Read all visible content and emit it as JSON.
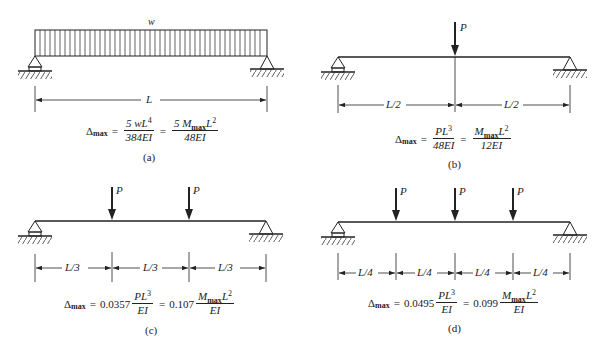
{
  "panels": [
    {
      "id": "a",
      "load_label": "w",
      "load_type": "uniform distributed",
      "dimensions": [
        "L"
      ],
      "formula": {
        "lhs": "Δ",
        "lhs_sub": "max",
        "eq": "=",
        "term1_coef": "",
        "term1_num": "5 wL",
        "term1_num_sup": "4",
        "term1_den": "384EI",
        "eq2": "=",
        "term2_coef": "",
        "term2_num_pre": "5 M",
        "term2_num_sub": "max",
        "term2_num_post": "L",
        "term2_num_sup": "2",
        "term2_den": "48EI"
      },
      "caption": "(a)"
    },
    {
      "id": "b",
      "load_label": "P",
      "load_type": "single point load at midspan",
      "dimensions": [
        "L/2",
        "L/2"
      ],
      "formula": {
        "lhs": "Δ",
        "lhs_sub": "max",
        "eq": "=",
        "term1_coef": "",
        "term1_num": "PL",
        "term1_num_sup": "3",
        "term1_den": "48EI",
        "eq2": "=",
        "term2_coef": "",
        "term2_num_pre": "M",
        "term2_num_sub": "max",
        "term2_num_post": "L",
        "term2_num_sup": "2",
        "term2_den": "12EI"
      },
      "caption": "(b)"
    },
    {
      "id": "c",
      "load_label": "P",
      "load_type": "two point loads at third points",
      "dimensions": [
        "L/3",
        "L/3",
        "L/3"
      ],
      "formula": {
        "lhs": "Δ",
        "lhs_sub": "max",
        "eq": "=",
        "term1_coef": "0.0357",
        "term1_num": "PL",
        "term1_num_sup": "3",
        "term1_den": "EI",
        "eq2": "=",
        "term2_coef": "0.107",
        "term2_num_pre": "M",
        "term2_num_sub": "max",
        "term2_num_post": "L",
        "term2_num_sup": "2",
        "term2_den": "EI"
      },
      "caption": "(c)"
    },
    {
      "id": "d",
      "load_label": "P",
      "load_type": "three point loads at quarter points",
      "dimensions": [
        "L/4",
        "L/4",
        "L/4",
        "L/4"
      ],
      "formula": {
        "lhs": "Δ",
        "lhs_sub": "max",
        "eq": "=",
        "term1_coef": "0.0495",
        "term1_num": "PL",
        "term1_num_sup": "3",
        "term1_den": "EI",
        "eq2": "=",
        "term2_coef": "0.099",
        "term2_num_pre": "M",
        "term2_num_sub": "max",
        "term2_num_post": "L",
        "term2_num_sup": "2",
        "term2_den": "EI"
      },
      "caption": "(d)"
    }
  ],
  "colors": {
    "ink": "#222222",
    "background": "#ffffff"
  }
}
